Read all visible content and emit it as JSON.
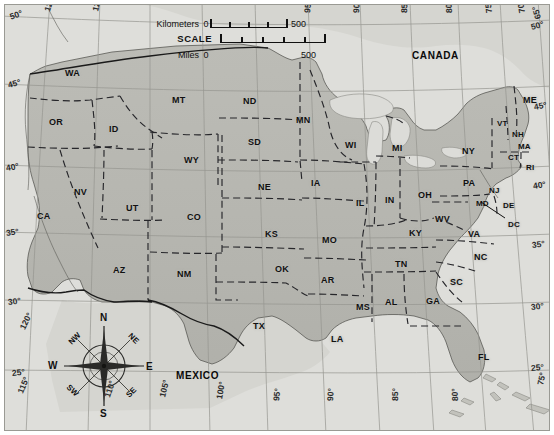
{
  "title": "UNITED STATES",
  "scale": {
    "label": "SCALE",
    "kilometers_label": "Kilometers",
    "km_start": "0",
    "km_end": "500",
    "miles_label": "Miles",
    "mi_start": "0",
    "mi_end": "500"
  },
  "countries": [
    {
      "name": "CANADA",
      "x": 412,
      "y": 50
    },
    {
      "name": "MEXICO",
      "x": 176,
      "y": 370
    }
  ],
  "states": [
    {
      "code": "WA",
      "x": 65,
      "y": 68
    },
    {
      "code": "MT",
      "x": 172,
      "y": 95
    },
    {
      "code": "ND",
      "x": 243,
      "y": 96
    },
    {
      "code": "MN",
      "x": 296,
      "y": 115
    },
    {
      "code": "OR",
      "x": 49,
      "y": 117
    },
    {
      "code": "ID",
      "x": 109,
      "y": 124
    },
    {
      "code": "SD",
      "x": 248,
      "y": 137
    },
    {
      "code": "WI",
      "x": 345,
      "y": 140
    },
    {
      "code": "MI",
      "x": 392,
      "y": 143
    },
    {
      "code": "NY",
      "x": 462,
      "y": 146
    },
    {
      "code": "WY",
      "x": 184,
      "y": 155
    },
    {
      "code": "VT",
      "x": 497,
      "y": 119
    },
    {
      "code": "NH",
      "x": 512,
      "y": 130
    },
    {
      "code": "MA",
      "x": 518,
      "y": 142
    },
    {
      "code": "ME",
      "x": 523,
      "y": 95
    },
    {
      "code": "CT",
      "x": 508,
      "y": 153
    },
    {
      "code": "RI",
      "x": 526,
      "y": 163
    },
    {
      "code": "NE",
      "x": 258,
      "y": 182
    },
    {
      "code": "IA",
      "x": 311,
      "y": 178
    },
    {
      "code": "IL",
      "x": 356,
      "y": 198
    },
    {
      "code": "IN",
      "x": 385,
      "y": 195
    },
    {
      "code": "OH",
      "x": 418,
      "y": 190
    },
    {
      "code": "PA",
      "x": 463,
      "y": 178
    },
    {
      "code": "NJ",
      "x": 489,
      "y": 186
    },
    {
      "code": "NV",
      "x": 74,
      "y": 187
    },
    {
      "code": "UT",
      "x": 126,
      "y": 203
    },
    {
      "code": "CO",
      "x": 187,
      "y": 212
    },
    {
      "code": "KS",
      "x": 265,
      "y": 229
    },
    {
      "code": "MO",
      "x": 322,
      "y": 235
    },
    {
      "code": "KY",
      "x": 409,
      "y": 228
    },
    {
      "code": "WV",
      "x": 435,
      "y": 214
    },
    {
      "code": "MD",
      "x": 476,
      "y": 199
    },
    {
      "code": "DE",
      "x": 503,
      "y": 201
    },
    {
      "code": "DC",
      "x": 508,
      "y": 220
    },
    {
      "code": "VA",
      "x": 468,
      "y": 229
    },
    {
      "code": "NC",
      "x": 474,
      "y": 252
    },
    {
      "code": "CA",
      "x": 37,
      "y": 211
    },
    {
      "code": "AZ",
      "x": 113,
      "y": 265
    },
    {
      "code": "NM",
      "x": 177,
      "y": 269
    },
    {
      "code": "OK",
      "x": 275,
      "y": 264
    },
    {
      "code": "AR",
      "x": 321,
      "y": 275
    },
    {
      "code": "TN",
      "x": 395,
      "y": 259
    },
    {
      "code": "SC",
      "x": 450,
      "y": 277
    },
    {
      "code": "MS",
      "x": 356,
      "y": 302
    },
    {
      "code": "AL",
      "x": 385,
      "y": 297
    },
    {
      "code": "GA",
      "x": 426,
      "y": 296
    },
    {
      "code": "TX",
      "x": 253,
      "y": 321
    },
    {
      "code": "LA",
      "x": 331,
      "y": 334
    },
    {
      "code": "FL",
      "x": 478,
      "y": 352
    }
  ],
  "graticule_labels": [
    {
      "text": "50°",
      "x": 10,
      "y": 12,
      "rot": -20
    },
    {
      "text": "45°",
      "x": 8,
      "y": 80,
      "rot": -15
    },
    {
      "text": "40°",
      "x": 6,
      "y": 163,
      "rot": -10
    },
    {
      "text": "35°",
      "x": 6,
      "y": 228,
      "rot": -8
    },
    {
      "text": "30°",
      "x": 8,
      "y": 297,
      "rot": -7
    },
    {
      "text": "25°",
      "x": 12,
      "y": 368,
      "rot": -6
    },
    {
      "text": "125°",
      "x": 47,
      "y": 6,
      "rot": -72
    },
    {
      "text": "120°",
      "x": 95,
      "y": 6,
      "rot": -76
    },
    {
      "text": "95°",
      "x": 307,
      "y": 8,
      "rot": -84
    },
    {
      "text": "90°",
      "x": 356,
      "y": 8,
      "rot": -86
    },
    {
      "text": "85°",
      "x": 404,
      "y": 8,
      "rot": -88
    },
    {
      "text": "80°",
      "x": 449,
      "y": 8,
      "rot": -92
    },
    {
      "text": "75°",
      "x": 489,
      "y": 8,
      "rot": -96
    },
    {
      "text": "70°",
      "x": 522,
      "y": 8,
      "rot": -100
    },
    {
      "text": "65°",
      "x": 538,
      "y": 14,
      "rot": -105
    },
    {
      "text": "50°",
      "x": 531,
      "y": 22,
      "rot": -14
    },
    {
      "text": "45°",
      "x": 534,
      "y": 102,
      "rot": -11
    },
    {
      "text": "40°",
      "x": 533,
      "y": 181,
      "rot": -9
    },
    {
      "text": "35°",
      "x": 532,
      "y": 240,
      "rot": -7
    },
    {
      "text": "30°",
      "x": 531,
      "y": 302,
      "rot": -6
    },
    {
      "text": "25°",
      "x": 531,
      "y": 363,
      "rot": -5
    },
    {
      "text": "75°",
      "x": 540,
      "y": 380,
      "rot": -78
    },
    {
      "text": "120°",
      "x": 22,
      "y": 324,
      "rot": -64
    },
    {
      "text": "115°",
      "x": 20,
      "y": 388,
      "rot": -68
    },
    {
      "text": "110°",
      "x": 107,
      "y": 392,
      "rot": -72
    },
    {
      "text": "105°",
      "x": 162,
      "y": 392,
      "rot": -76
    },
    {
      "text": "100°",
      "x": 219,
      "y": 394,
      "rot": -80
    },
    {
      "text": "95°",
      "x": 276,
      "y": 396,
      "rot": -83
    },
    {
      "text": "90°",
      "x": 330,
      "y": 396,
      "rot": -86
    },
    {
      "text": "85°",
      "x": 395,
      "y": 396,
      "rot": -89
    },
    {
      "text": "80°",
      "x": 455,
      "y": 396,
      "rot": -92
    }
  ],
  "compass": {
    "n": "N",
    "ne": "NE",
    "e": "E",
    "se": "SE",
    "s": "S",
    "sw": "SW",
    "w": "W",
    "nw": "NW"
  },
  "colors": {
    "land": "#b6b6b0",
    "ocean": "#dcdcd8",
    "border": "#2a2a28",
    "graticule": "#8f8f8a",
    "text": "#111111"
  }
}
